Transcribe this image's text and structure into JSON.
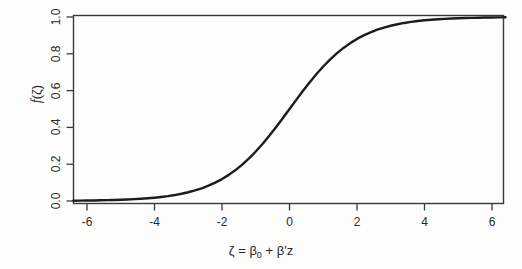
{
  "chart_data": {
    "type": "line",
    "title": "",
    "xlabel": "ζ = β₀ + β'z",
    "ylabel": "f(ζ)",
    "xlim": [
      -6.6,
      6.6
    ],
    "ylim": [
      -0.02,
      1.02
    ],
    "xticks": [
      "-6",
      "-4",
      "-2",
      "0",
      "2",
      "4",
      "6"
    ],
    "xtick_values": [
      -6,
      -4,
      -2,
      0,
      2,
      4,
      6
    ],
    "yticks": [
      "0.0",
      "0.2",
      "0.4",
      "0.6",
      "0.8",
      "1.0"
    ],
    "ytick_values": [
      0.0,
      0.2,
      0.4,
      0.6,
      0.8,
      1.0
    ],
    "grid": false,
    "legend": "none",
    "box": "full-rectangle",
    "series": [
      {
        "name": "logistic f(ζ) = 1/(1+exp(-ζ))",
        "color": "#1c1c1c",
        "line_width": 2.4,
        "x": [
          -6.6,
          -6.4,
          -6.2,
          -6.0,
          -5.8,
          -5.6,
          -5.4,
          -5.2,
          -5.0,
          -4.8,
          -4.6,
          -4.4,
          -4.2,
          -4.0,
          -3.8,
          -3.6,
          -3.4,
          -3.2,
          -3.0,
          -2.8,
          -2.6,
          -2.4,
          -2.2,
          -2.0,
          -1.8,
          -1.6,
          -1.4,
          -1.2,
          -1.0,
          -0.8,
          -0.6,
          -0.4,
          -0.2,
          0.0,
          0.2,
          0.4,
          0.6,
          0.8,
          1.0,
          1.2,
          1.4,
          1.6,
          1.8,
          2.0,
          2.2,
          2.4,
          2.6,
          2.8,
          3.0,
          3.2,
          3.4,
          3.6,
          3.8,
          4.0,
          4.2,
          4.4,
          4.6,
          4.8,
          5.0,
          5.2,
          5.4,
          5.6,
          5.8,
          6.0,
          6.2,
          6.4,
          6.6
        ],
        "y": [
          0.0014,
          0.0017,
          0.002,
          0.0025,
          0.003,
          0.0037,
          0.0045,
          0.0055,
          0.0067,
          0.0082,
          0.01,
          0.0121,
          0.0148,
          0.018,
          0.0219,
          0.0266,
          0.0323,
          0.0392,
          0.0474,
          0.0573,
          0.0691,
          0.0832,
          0.0998,
          0.1192,
          0.1419,
          0.168,
          0.1978,
          0.2315,
          0.2689,
          0.31,
          0.3543,
          0.4013,
          0.4502,
          0.5,
          0.5498,
          0.5987,
          0.6457,
          0.69,
          0.7311,
          0.7685,
          0.8022,
          0.832,
          0.8581,
          0.8808,
          0.9002,
          0.9168,
          0.9309,
          0.9427,
          0.9526,
          0.9608,
          0.9677,
          0.9734,
          0.9781,
          0.982,
          0.9852,
          0.9879,
          0.99,
          0.9918,
          0.9933,
          0.9945,
          0.9955,
          0.9963,
          0.997,
          0.9975,
          0.998,
          0.9983,
          0.9986
        ]
      }
    ]
  },
  "figure": {
    "axis_color": "#3a3a3a",
    "background": "#fdfdfc"
  }
}
